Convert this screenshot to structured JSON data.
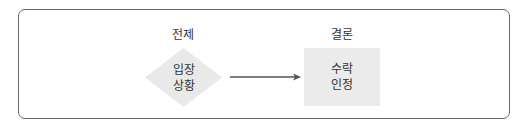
{
  "diagram": {
    "type": "flow",
    "frame": {
      "border_color": "#6a6a6a",
      "background": "#ffffff"
    },
    "nodes": [
      {
        "id": "premise",
        "shape": "diamond",
        "caption": "전제",
        "lines": [
          "입장",
          "상황"
        ],
        "fill": "#e9e9e9"
      },
      {
        "id": "conclusion",
        "shape": "rectangle",
        "caption": "결론",
        "lines": [
          "수락",
          "인정"
        ],
        "fill": "#ebebeb"
      }
    ],
    "edges": [
      {
        "from": "premise",
        "to": "conclusion",
        "style": "arrow",
        "color": "#555555"
      }
    ],
    "text_color": "#333333"
  }
}
